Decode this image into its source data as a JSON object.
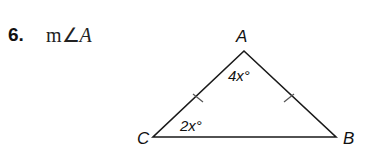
{
  "problem": {
    "number": "6.",
    "prefix": "m∠",
    "variable": "A"
  },
  "figure": {
    "vertices": {
      "A": "A",
      "B": "B",
      "C": "C"
    },
    "angle_labels": {
      "A": "4x°",
      "C": "2x°"
    },
    "tick_marks": [
      "AC",
      "AB"
    ],
    "stroke_color": "#1a1a1a"
  }
}
